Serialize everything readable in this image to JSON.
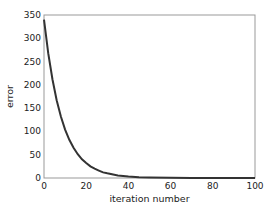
{
  "chart_data": {
    "type": "line",
    "title": "",
    "xlabel": "iteration number",
    "ylabel": "error",
    "xlim": [
      0,
      100
    ],
    "ylim": [
      0,
      350
    ],
    "xticks": [
      0,
      20,
      40,
      60,
      80,
      100
    ],
    "yticks": [
      0,
      50,
      100,
      150,
      200,
      250,
      300,
      350
    ],
    "grid": false,
    "legend": null,
    "series": [
      {
        "name": "error",
        "color": "#333333",
        "x": [
          0,
          2,
          4,
          6,
          8,
          10,
          12,
          14,
          16,
          18,
          20,
          22,
          24,
          26,
          28,
          30,
          35,
          40,
          45,
          50,
          60,
          70,
          80,
          90,
          100
        ],
        "values": [
          340,
          268,
          212,
          167,
          132,
          104,
          82,
          65,
          51,
          40,
          32,
          25,
          20,
          16,
          12,
          10,
          5.6,
          3.1,
          1.7,
          1.0,
          0.3,
          0.1,
          0,
          0,
          0
        ]
      }
    ]
  }
}
